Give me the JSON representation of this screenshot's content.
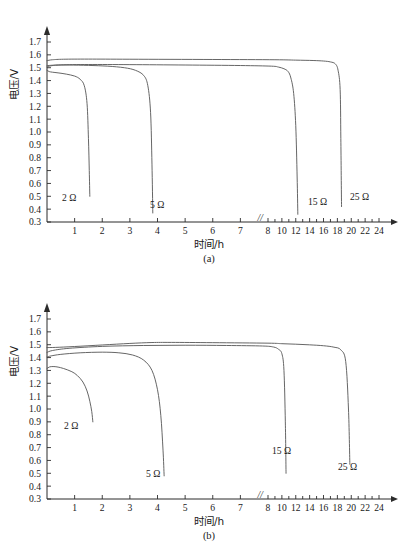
{
  "figure": {
    "panels": [
      "(a)",
      "(b)"
    ],
    "axis": {
      "ylabel": "电压/V",
      "xlabel": "时间/h",
      "y_ticks": [
        "1.7",
        "1.6",
        "1.5",
        "1.4",
        "1.3",
        "1.2",
        "1.1",
        "1.0",
        "0.9",
        "0.8",
        "0.7",
        "0.6",
        "0.5",
        "0.4",
        "0.3"
      ],
      "x_ticks_linear": [
        "1",
        "2",
        "3",
        "4",
        "5",
        "6",
        "7",
        "8"
      ],
      "x_ticks_compressed": [
        "10",
        "12",
        "14",
        "16",
        "18",
        "20",
        "22",
        "24"
      ],
      "break_symbol": "//"
    },
    "series_labels": [
      "2 Ω",
      "5 Ω",
      "15 Ω",
      "25 Ω"
    ]
  },
  "chart_data": [
    {
      "type": "line",
      "title": "(a)",
      "xlabel": "时间/h",
      "ylabel": "电压/V",
      "ylim": [
        0.3,
        1.7
      ],
      "xlim": [
        0,
        24
      ],
      "grid": false,
      "legend": "inline-annotations",
      "x_axis_note": "linear 0-8 h, axis break between 7 and 8, compressed 8-24 h",
      "series": [
        {
          "name": "2 Ω",
          "label": "2 Ω",
          "x": [
            0,
            0.08,
            0.2,
            0.4,
            0.7,
            1.0,
            1.2,
            1.35,
            1.45,
            1.5,
            1.53,
            1.55
          ],
          "y": [
            1.48,
            1.47,
            1.465,
            1.46,
            1.45,
            1.435,
            1.41,
            1.36,
            1.22,
            0.95,
            0.7,
            0.5
          ]
        },
        {
          "name": "5 Ω",
          "label": "5 Ω",
          "x": [
            0,
            0.1,
            0.3,
            0.8,
            1.5,
            2.2,
            2.8,
            3.2,
            3.5,
            3.65,
            3.75,
            3.8,
            3.83
          ],
          "y": [
            1.515,
            1.518,
            1.52,
            1.521,
            1.518,
            1.512,
            1.5,
            1.48,
            1.44,
            1.36,
            1.15,
            0.75,
            0.37
          ]
        },
        {
          "name": "15 Ω",
          "label": "15 Ω",
          "x": [
            0,
            0.15,
            0.5,
            1.5,
            3.0,
            5.0,
            7.0,
            8.5,
            9.5,
            10.3,
            10.9,
            11.3,
            11.7,
            12.0,
            12.2,
            12.3
          ],
          "y": [
            1.505,
            1.515,
            1.522,
            1.525,
            1.524,
            1.521,
            1.517,
            1.512,
            1.505,
            1.492,
            1.47,
            1.42,
            1.3,
            1.05,
            0.65,
            0.36
          ]
        },
        {
          "name": "25 Ω",
          "label": "25 Ω",
          "x": [
            0,
            0.2,
            0.6,
            1.5,
            3.0,
            6.0,
            9.0,
            12.0,
            14.5,
            16.0,
            17.0,
            17.7,
            18.1,
            18.4,
            18.5,
            18.6
          ],
          "y": [
            1.555,
            1.562,
            1.566,
            1.567,
            1.566,
            1.564,
            1.562,
            1.559,
            1.556,
            1.552,
            1.545,
            1.53,
            1.48,
            1.33,
            0.95,
            0.42
          ]
        }
      ]
    },
    {
      "type": "line",
      "title": "(b)",
      "xlabel": "时间/h",
      "ylabel": "电压/V",
      "ylim": [
        0.3,
        1.7
      ],
      "xlim": [
        0,
        24
      ],
      "grid": false,
      "legend": "inline-annotations",
      "x_axis_note": "linear 0-8 h, axis break between 7 and 8, compressed 8-24 h",
      "series": [
        {
          "name": "2 Ω",
          "label": "2 Ω",
          "x": [
            0,
            0.1,
            0.25,
            0.4,
            0.6,
            0.9,
            1.1,
            1.3,
            1.45,
            1.55,
            1.62,
            1.66
          ],
          "y": [
            1.315,
            1.328,
            1.33,
            1.326,
            1.315,
            1.29,
            1.26,
            1.21,
            1.14,
            1.06,
            0.98,
            0.9
          ]
        },
        {
          "name": "5 Ω",
          "label": "5 Ω",
          "x": [
            0,
            0.15,
            0.5,
            1.2,
            2.0,
            2.6,
            3.1,
            3.5,
            3.8,
            4.0,
            4.12,
            4.2,
            4.24
          ],
          "y": [
            1.405,
            1.413,
            1.425,
            1.437,
            1.442,
            1.437,
            1.42,
            1.38,
            1.3,
            1.15,
            0.95,
            0.68,
            0.48
          ]
        },
        {
          "name": "15 Ω",
          "label": "15 Ω",
          "x": [
            0,
            0.2,
            0.8,
            2.0,
            3.5,
            5.0,
            6.5,
            7.8,
            8.8,
            9.5,
            10.0,
            10.3,
            10.5,
            10.6
          ],
          "y": [
            1.44,
            1.455,
            1.472,
            1.487,
            1.494,
            1.496,
            1.494,
            1.49,
            1.482,
            1.465,
            1.43,
            1.3,
            0.9,
            0.5
          ]
        },
        {
          "name": "25 Ω",
          "label": "25 Ω",
          "x": [
            0,
            0.3,
            1.0,
            2.0,
            3.0,
            3.8,
            4.5,
            6.0,
            8.0,
            10.0,
            12.0,
            14.0,
            16.0,
            17.5,
            18.5,
            19.2,
            19.6,
            19.8
          ],
          "y": [
            1.478,
            1.479,
            1.486,
            1.498,
            1.51,
            1.517,
            1.518,
            1.516,
            1.512,
            1.508,
            1.504,
            1.499,
            1.492,
            1.481,
            1.46,
            1.37,
            1.0,
            0.57
          ]
        }
      ]
    }
  ]
}
